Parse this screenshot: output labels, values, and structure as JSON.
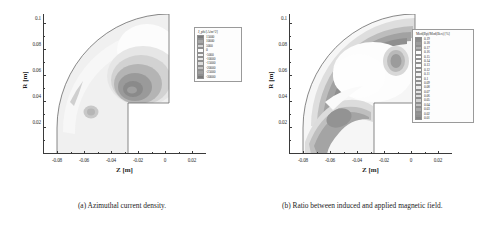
{
  "figure": {
    "panels": [
      {
        "id": "a",
        "caption": "(a) Azimuthal current density.",
        "axes": {
          "xlabel": "Z [m]",
          "ylabel": "R [m]",
          "xticks": [
            "-0.08",
            "-0.06",
            "-0.04",
            "-0.02",
            "0",
            "0.02"
          ],
          "xtick_values": [
            -0.08,
            -0.06,
            -0.04,
            -0.02,
            0,
            0.02
          ],
          "yticks": [
            "0.02",
            "0.04",
            "0.06",
            "0.08",
            "0.1"
          ],
          "ytick_values": [
            0.02,
            0.04,
            0.06,
            0.08,
            0.1
          ],
          "xlim": [
            -0.09,
            0.03
          ],
          "ylim": [
            0.0,
            0.108
          ]
        },
        "legend": {
          "title": "J_phi [A/m^2]",
          "entries": [
            {
              "label": "15000",
              "value": 15000,
              "color": "#7b7b7b"
            },
            {
              "label": "10000",
              "value": 10000,
              "color": "#a6a6a6"
            },
            {
              "label": "5000",
              "value": 5000,
              "color": "#d4d4d4"
            },
            {
              "label": "0",
              "value": 0,
              "color": "#fbfbfb"
            },
            {
              "label": "-5000",
              "value": -5000,
              "color": "#f2f2f2"
            },
            {
              "label": "-10000",
              "value": -10000,
              "color": "#e8e8e8"
            },
            {
              "label": "-15000",
              "value": -15000,
              "color": "#dcdcdc"
            },
            {
              "label": "-20000",
              "value": -20000,
              "color": "#c4c4c4"
            },
            {
              "label": "-25000",
              "value": -25000,
              "color": "#9e9e9e"
            },
            {
              "label": "-30000",
              "value": -30000,
              "color": "#7a7a7a"
            }
          ]
        }
      },
      {
        "id": "b",
        "caption": "(b) Ratio between induced and applied magnetic field.",
        "axes": {
          "xlabel": "Z [m]",
          "ylabel": "R [m]",
          "xticks": [
            "-0.08",
            "-0.06",
            "-0.04",
            "-0.02",
            "0",
            "0.02"
          ],
          "xtick_values": [
            -0.08,
            -0.06,
            -0.04,
            -0.02,
            0,
            0.02
          ],
          "yticks": [
            "0.02",
            "0.04",
            "0.06",
            "0.08",
            "0.1"
          ],
          "ytick_values": [
            0.02,
            0.04,
            0.06,
            0.08,
            0.1
          ],
          "xlim": [
            -0.09,
            0.03
          ],
          "ylim": [
            0.0,
            0.108
          ]
        },
        "legend": {
          "title": "Mod(Bp)/Mod(Bex) [%]",
          "entries": [
            {
              "label": "0.19",
              "value": 0.19,
              "color": "#8a8a8a"
            },
            {
              "label": "0.18",
              "value": 0.18,
              "color": "#9c9c9c"
            },
            {
              "label": "0.17",
              "value": 0.17,
              "color": "#b0b0b0"
            },
            {
              "label": "0.16",
              "value": 0.16,
              "color": "#fcfcfc"
            },
            {
              "label": "0.15",
              "value": 0.15,
              "color": "#fbfbfb"
            },
            {
              "label": "0.14",
              "value": 0.14,
              "color": "#fafafa"
            },
            {
              "label": "0.13",
              "value": 0.13,
              "color": "#f8f8f8"
            },
            {
              "label": "0.12",
              "value": 0.12,
              "color": "#f6f6f6"
            },
            {
              "label": "0.11",
              "value": 0.11,
              "color": "#f4f4f4"
            },
            {
              "label": "0.1",
              "value": 0.1,
              "color": "#f1f1f1"
            },
            {
              "label": "0.09",
              "value": 0.09,
              "color": "#eeeeee"
            },
            {
              "label": "0.08",
              "value": 0.08,
              "color": "#eaeaea"
            },
            {
              "label": "0.07",
              "value": 0.07,
              "color": "#e4e4e4"
            },
            {
              "label": "0.06",
              "value": 0.06,
              "color": "#dcdcdc"
            },
            {
              "label": "0.05",
              "value": 0.05,
              "color": "#d0d0d0"
            },
            {
              "label": "0.04",
              "value": 0.04,
              "color": "#c0c0c0"
            },
            {
              "label": "0.03",
              "value": 0.03,
              "color": "#a8a8a8"
            },
            {
              "label": "0.02",
              "value": 0.02,
              "color": "#949494"
            },
            {
              "label": "0.01",
              "value": 0.01,
              "color": "#848484"
            }
          ]
        }
      }
    ]
  },
  "chart_data": {
    "type": "heatmap",
    "title": "",
    "panels": [
      {
        "name": "Azimuthal current density",
        "xlabel": "Z [m]",
        "ylabel": "R [m]",
        "xlim": [
          -0.09,
          0.03
        ],
        "ylim": [
          0.0,
          0.108
        ],
        "grid": false,
        "legend_position": "right-outside",
        "colorbar_label": "J_phi [A/m^2]",
        "levels": [
          15000,
          10000,
          5000,
          0,
          -5000,
          -10000,
          -15000,
          -20000,
          -25000,
          -30000
        ],
        "features": [
          {
            "type": "domain-boundary",
            "shape": "quarter-annulus with rectangular notch"
          },
          {
            "type": "peak-negative",
            "z": -0.022,
            "r": 0.045,
            "value": -30000
          },
          {
            "type": "secondary-blob",
            "z": -0.047,
            "r": 0.029,
            "value": -15000
          },
          {
            "type": "thin-streak",
            "z": -0.066,
            "r": 0.04,
            "value": -10000
          }
        ]
      },
      {
        "name": "Ratio between induced and applied magnetic field",
        "xlabel": "Z [m]",
        "ylabel": "R [m]",
        "xlim": [
          -0.09,
          0.03
        ],
        "ylim": [
          0.0,
          0.108
        ],
        "grid": false,
        "legend_position": "right-outside",
        "colorbar_label": "Mod(Bp)/Mod(Bex) [%]",
        "levels": [
          0.19,
          0.18,
          0.17,
          0.16,
          0.15,
          0.14,
          0.13,
          0.12,
          0.11,
          0.1,
          0.09,
          0.08,
          0.07,
          0.06,
          0.05,
          0.04,
          0.03,
          0.02,
          0.01
        ],
        "features": [
          {
            "type": "domain-boundary",
            "shape": "quarter-annulus with rectangular notch"
          },
          {
            "type": "arc-band-high",
            "z": -0.05,
            "r": 0.088,
            "value": 0.19
          },
          {
            "type": "isolated-blob",
            "z": -0.017,
            "r": 0.064,
            "value": 0.18
          },
          {
            "type": "lower-left-band",
            "z": -0.058,
            "r": 0.032,
            "value": 0.19
          }
        ]
      }
    ]
  }
}
